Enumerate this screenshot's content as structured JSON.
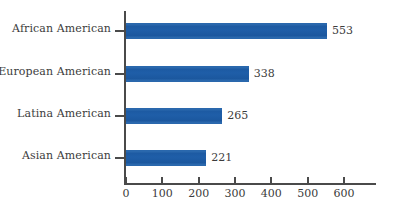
{
  "chart_data": {
    "type": "bar",
    "orientation": "horizontal",
    "title": "",
    "subtitle": "",
    "xlabel": "",
    "ylabel": "",
    "categories": [
      "African American",
      "European American",
      "Latina American",
      "Asian American"
    ],
    "values": [
      553,
      338,
      265,
      221
    ],
    "data_labels": [
      "553",
      "338",
      "265",
      "221"
    ],
    "xlim": [
      0,
      600
    ],
    "x_ticks": [
      0,
      100,
      200,
      300,
      400,
      500,
      600
    ],
    "x_tick_labels": [
      "0",
      "100",
      "200",
      "300",
      "400",
      "500",
      "600"
    ],
    "grid": false,
    "legend": false,
    "legend_position": "none",
    "series": [
      {
        "name": "",
        "values": [
          553,
          338,
          265,
          221
        ]
      }
    ],
    "colors": {
      "bar": "#1f5ea8",
      "axis": "#4a4a4a",
      "text": "#3c3c3c",
      "background": "#ffffff"
    }
  }
}
